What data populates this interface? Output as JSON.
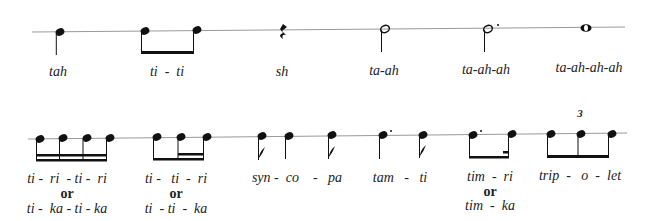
{
  "colors": {
    "ink": "#111111",
    "staff": "#888888",
    "text": "#222222"
  },
  "row1": {
    "items": [
      {
        "id": "quarter",
        "label": "tah",
        "symbol": "quarter-note"
      },
      {
        "id": "eighths",
        "label": "ti  -  ti",
        "symbol": "beamed-eighth-pair"
      },
      {
        "id": "rest",
        "label": "sh",
        "symbol": "quarter-rest"
      },
      {
        "id": "half",
        "label": "ta-ah",
        "symbol": "half-note"
      },
      {
        "id": "dotted-half",
        "label": "ta-ah-ah",
        "symbol": "dotted-half-note"
      },
      {
        "id": "whole",
        "label": "ta-ah-ah-ah",
        "symbol": "whole-note"
      }
    ]
  },
  "row2": {
    "items": [
      {
        "id": "sixteenths",
        "label": "ti -  ri  - ti -  ri",
        "or": "or",
        "alt": "ti -  ka - ti - ka",
        "symbol": "four-sixteenths"
      },
      {
        "id": "eighth-two-sixteenths",
        "label": "ti -   ti  -  ri",
        "or": "or",
        "alt": "ti  - ti  -  ka",
        "symbol": "eighth-two-sixteenths"
      },
      {
        "id": "syncopa",
        "label": "syn -  co    -   pa",
        "symbol": "eighth-quarter-eighth"
      },
      {
        "id": "tamti",
        "label": "tam   -   ti",
        "symbol": "dotted-quarter-eighth"
      },
      {
        "id": "timri",
        "label": "tim  -  ri",
        "or": "or",
        "alt": "tim  -  ka",
        "symbol": "dotted-eighth-sixteenth"
      },
      {
        "id": "triplet",
        "label": "trip  -   o  -  let",
        "tuplet": "3",
        "symbol": "eighth-triplet"
      }
    ]
  }
}
